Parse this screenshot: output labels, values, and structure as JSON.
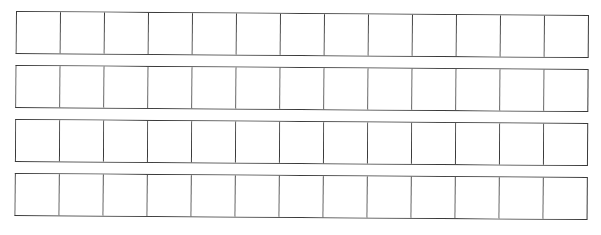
{
  "worksheet": {
    "type": "blank-box-grid",
    "rows": 4,
    "cells_per_row": 13,
    "line_color": "#3a3a3a",
    "background_color": "#ffffff",
    "cell_contents": [
      [
        "",
        "",
        "",
        "",
        "",
        "",
        "",
        "",
        "",
        "",
        "",
        "",
        ""
      ],
      [
        "",
        "",
        "",
        "",
        "",
        "",
        "",
        "",
        "",
        "",
        "",
        "",
        ""
      ],
      [
        "",
        "",
        "",
        "",
        "",
        "",
        "",
        "",
        "",
        "",
        "",
        "",
        ""
      ],
      [
        "",
        "",
        "",
        "",
        "",
        "",
        "",
        "",
        "",
        "",
        "",
        "",
        ""
      ]
    ]
  }
}
